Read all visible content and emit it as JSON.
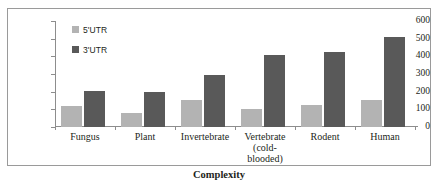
{
  "chart_data": {
    "type": "bar",
    "title": "",
    "xlabel": "Complexity",
    "ylabel": "Mean UTR length (nt)",
    "ylim": [
      0,
      600
    ],
    "yticks": [
      0,
      100,
      200,
      300,
      400,
      500,
      600
    ],
    "grid": false,
    "legend_position": "top-left",
    "categories": [
      "Fungus",
      "Plant",
      "Invertebrate",
      "Vertebrate\n(cold-\nblooded)",
      "Rodent",
      "Human"
    ],
    "category_labels_flat": [
      "Fungus",
      "Plant",
      "Invertebrate",
      "Vertebrate (cold-blooded)",
      "Rodent",
      "Human"
    ],
    "series": [
      {
        "name": "5'UTR",
        "color": "#b3b3b3",
        "values": [
          118,
          80,
          152,
          100,
          122,
          152
        ]
      },
      {
        "name": "3'UTR",
        "color": "#595959",
        "values": [
          205,
          198,
          295,
          405,
          425,
          512
        ]
      }
    ]
  },
  "legend": {
    "items": [
      {
        "label": "5'UTR",
        "swatch": "legend-swatch-5utr"
      },
      {
        "label": "3'UTR",
        "swatch": "legend-swatch-3utr"
      }
    ]
  },
  "axes": {
    "y_title": "Mean UTR length (nt)",
    "x_title": "Complexity",
    "y_tick_labels": [
      "600",
      "500",
      "400",
      "300",
      "200",
      "100",
      "0"
    ]
  },
  "colors": {
    "utr5": "#b3b3b3",
    "utr3": "#595959",
    "axis": "#8d8d8d",
    "border": "#9a9a9a",
    "text": "#231f20",
    "background": "#ffffff"
  }
}
